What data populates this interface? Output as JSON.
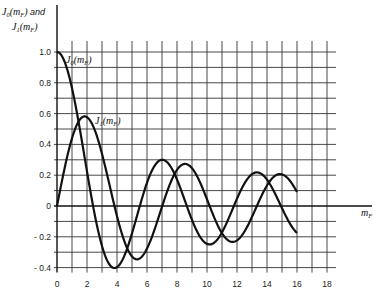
{
  "chart_data": {
    "type": "line",
    "title": "",
    "ylabel": "J0(mF) and J1(mF)",
    "ylabel_lines": [
      "J0(mF) and",
      "J1(mF)"
    ],
    "xlabel": "mF",
    "xlim": [
      0,
      18
    ],
    "ylim": [
      -0.4,
      1.0
    ],
    "grid": true,
    "grid_step": {
      "x": 1,
      "y": 0.1
    },
    "x_ticks": [
      0,
      2,
      4,
      6,
      8,
      10,
      12,
      14,
      16,
      18
    ],
    "y_ticks": [
      1.0,
      0.8,
      0.6,
      0.4,
      0.2,
      0,
      -0.2,
      -0.4
    ],
    "y_tick_labels": [
      "1.0",
      "0.8",
      "0.6",
      "0.4",
      "0.2",
      "0",
      "- 0.2",
      "- 0.4"
    ],
    "x_tick_labels": [
      "0",
      "2",
      "4",
      "6",
      "8",
      "10",
      "12",
      "14",
      "16",
      "18"
    ],
    "legend": "none (inline curve labels)",
    "annotations": [
      {
        "text": "J0(mF)",
        "x": 0.6,
        "y": 0.97
      },
      {
        "text": "J1(mF)",
        "x": 2.6,
        "y": 0.53
      }
    ],
    "x": [
      0,
      1,
      2,
      3,
      4,
      5,
      6,
      7,
      8,
      9,
      10,
      11,
      12,
      13,
      14,
      15,
      16
    ],
    "series": [
      {
        "name": "J0(mF)",
        "values": [
          1.0,
          0.77,
          0.22,
          -0.26,
          -0.4,
          -0.18,
          0.15,
          0.3,
          0.17,
          -0.09,
          -0.25,
          -0.17,
          0.05,
          0.21,
          0.17,
          -0.01,
          -0.17
        ]
      },
      {
        "name": "J1(mF)",
        "values": [
          0.0,
          0.44,
          0.58,
          0.34,
          -0.07,
          -0.33,
          -0.28,
          0.0,
          0.23,
          0.25,
          0.04,
          -0.18,
          -0.22,
          -0.07,
          0.13,
          0.21,
          0.09
        ]
      }
    ]
  },
  "labels": {
    "y_axis_line1_main": "J",
    "y_axis_line1_sub": "0",
    "y_axis_line1_arg": "(m",
    "y_axis_line1_argsub": "F",
    "y_axis_line1_close": ")",
    "y_axis_and": " and",
    "y_axis_line2_sub": "1",
    "x_axis_main": "m",
    "x_axis_sub": "F",
    "j0_sub": "0",
    "j1_sub": "1"
  }
}
